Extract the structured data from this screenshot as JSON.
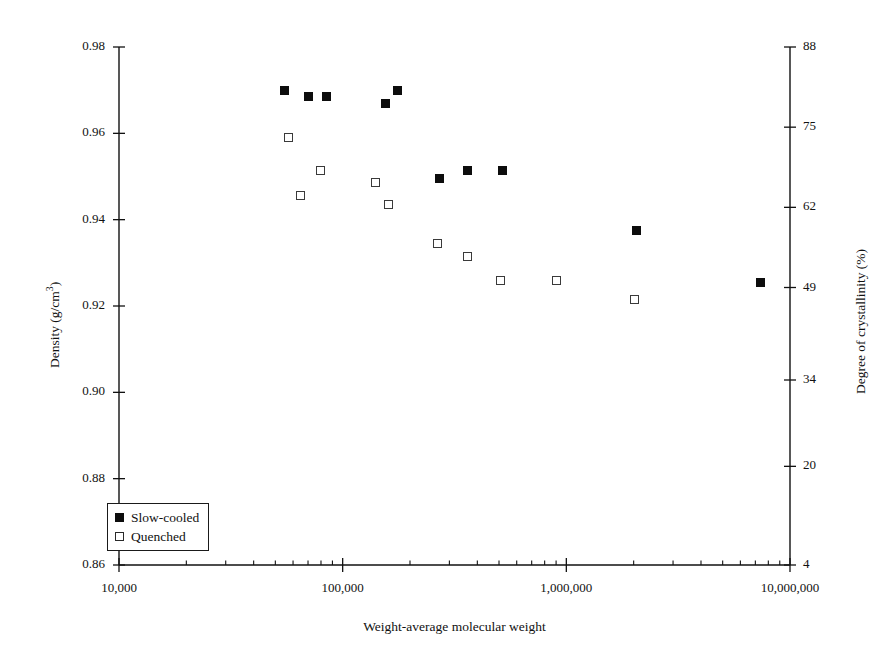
{
  "chart_data": {
    "type": "scatter",
    "title": "",
    "xlabel": "Weight-average molecular weight",
    "ylabel": "Density (g/cm³)",
    "ylabel_secondary": "Degree of crystallinity (%)",
    "xscale": "log",
    "xlim": [
      10000,
      10000000
    ],
    "ylim": [
      0.86,
      0.98
    ],
    "ylim_secondary": [
      4,
      88
    ],
    "grid": false,
    "xticks": [
      10000,
      100000,
      1000000,
      10000000
    ],
    "xtick_labels": [
      "10,000",
      "100,000",
      "1,000,000",
      "10,000,000"
    ],
    "yticks": [
      0.86,
      0.88,
      0.9,
      0.92,
      0.94,
      0.96,
      0.98
    ],
    "ytick_labels": [
      "0.86",
      "0.88",
      "0.90",
      "0.92",
      "0.94",
      "0.96",
      "0.98"
    ],
    "yticks_secondary": [
      4,
      20,
      34,
      49,
      62,
      75,
      88
    ],
    "ytick_labels_secondary": [
      "4",
      "20",
      "34",
      "49",
      "62",
      "75",
      "88"
    ],
    "legend_position": "lower left",
    "series": [
      {
        "name": "Slow-cooled",
        "marker": "filled-square",
        "color": "#0d0d0d",
        "points": [
          {
            "x": 55000,
            "y": 0.97
          },
          {
            "x": 70000,
            "y": 0.9685
          },
          {
            "x": 85000,
            "y": 0.9685
          },
          {
            "x": 155000,
            "y": 0.967
          },
          {
            "x": 175000,
            "y": 0.97
          },
          {
            "x": 270000,
            "y": 0.9495
          },
          {
            "x": 360000,
            "y": 0.9515
          },
          {
            "x": 520000,
            "y": 0.9515
          },
          {
            "x": 2050000,
            "y": 0.9375
          },
          {
            "x": 7400000,
            "y": 0.9255
          }
        ]
      },
      {
        "name": "Quenched",
        "marker": "open-square",
        "color": "#3a3a3a",
        "points": [
          {
            "x": 57000,
            "y": 0.959
          },
          {
            "x": 65000,
            "y": 0.9455
          },
          {
            "x": 80000,
            "y": 0.9515
          },
          {
            "x": 140000,
            "y": 0.9485
          },
          {
            "x": 160000,
            "y": 0.9435
          },
          {
            "x": 265000,
            "y": 0.9345
          },
          {
            "x": 360000,
            "y": 0.9315
          },
          {
            "x": 510000,
            "y": 0.926
          },
          {
            "x": 900000,
            "y": 0.926
          },
          {
            "x": 2020000,
            "y": 0.9215
          }
        ]
      }
    ]
  },
  "legend": {
    "items": [
      {
        "label": "Slow-cooled",
        "marker": "filled-square"
      },
      {
        "label": "Quenched",
        "marker": "open-square"
      }
    ]
  }
}
